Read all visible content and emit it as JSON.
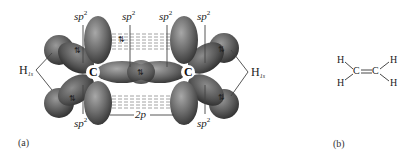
{
  "figure": {
    "panel_a": {
      "caption": "(a)",
      "hybrid_label_base": "sp",
      "hybrid_label_exp": "2",
      "p_orbital_label": "2p",
      "carbon_label": "C",
      "hydrogen_label_base": "H",
      "hydrogen_label_sub": "1s",
      "spin_pair_glyph": "⇅",
      "top_sp2_labels": [
        "sp2",
        "sp2",
        "sp2",
        "sp2"
      ],
      "bottom_sp2_labels": [
        "sp2",
        "sp2"
      ]
    },
    "panel_b": {
      "caption": "(b)",
      "atoms": {
        "h_top_left": "H",
        "h_bottom_left": "H",
        "c_left": "C",
        "c_right": "C",
        "h_top_right": "H",
        "h_bottom_right": "H"
      },
      "bond": "="
    },
    "colors": {
      "orbital_dark": "#3a3a3a",
      "orbital_mid": "#6e6e6e",
      "orbital_light": "#9a9a9a",
      "dash_line": "#8a8a8a",
      "label_line": "#444444",
      "text": "#222222"
    }
  }
}
